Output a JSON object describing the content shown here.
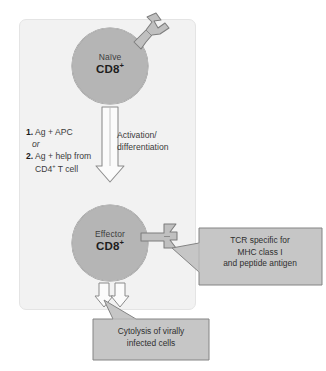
{
  "figure": {
    "panel_background": "#f2f2f2",
    "cell_fill": "#b5b5b5",
    "callout_fill": "#c6c6c6",
    "arrow_fill": "#fbfbfb",
    "outline": "#6e6e6e"
  },
  "cells": {
    "naive": {
      "name": "naive-cd8-t-cell",
      "line1": "Naïve",
      "line2": "CD8",
      "superscript": "+"
    },
    "effector": {
      "name": "effector-cd8-t-cell",
      "line1": "Effector",
      "line2": "CD8",
      "superscript": "+"
    }
  },
  "signals": {
    "item1_number": "1.",
    "item1_text": "Ag + APC",
    "conjunction": "or",
    "item2_number": "2.",
    "item2_text": "Ag + help from",
    "item2_cont": "CD4",
    "item2_cont_sup": "+",
    "item2_cont_end": " T cell"
  },
  "arrow_labels": {
    "activation_line1": "Activation/",
    "activation_line2": "differentiation"
  },
  "callouts": {
    "tcr": {
      "line1": "TCR specific for",
      "line2": "MHC class I",
      "line3": "and peptide antigen"
    },
    "cytolysis": {
      "line1": "Cytolysis of virally",
      "line2": "infected cells"
    }
  },
  "receptors": {
    "naive_tcr": "tcr-receptor-icon",
    "effector_tcr": "tcr-receptor-icon"
  }
}
